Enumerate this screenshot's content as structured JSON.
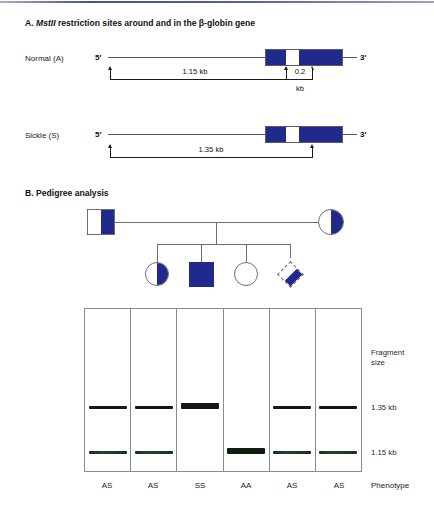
{
  "figure": {
    "panelA": {
      "heading_prefix": "A. ",
      "heading_italic": "MstII",
      "heading_rest": " restriction sites around and in the β-globin gene",
      "rows": [
        {
          "name": "Normal (A)",
          "five_prime": "5′",
          "three_prime": "3′",
          "measurements": [
            {
              "value": "1.15 kb"
            },
            {
              "value": "0.2",
              "unit": "kb"
            }
          ]
        },
        {
          "name": "Sickle (S)",
          "five_prime": "5′",
          "three_prime": "3′",
          "measurements": [
            {
              "value": "1.35 kb"
            }
          ]
        }
      ]
    },
    "panelB": {
      "heading": "B. Pedigree analysis",
      "symbols": [
        {
          "name": "father",
          "shape": "square",
          "fill": "half"
        },
        {
          "name": "mother",
          "shape": "circle",
          "fill": "half"
        },
        {
          "name": "child-1",
          "shape": "circle",
          "fill": "half"
        },
        {
          "name": "child-2",
          "shape": "square",
          "fill": "full"
        },
        {
          "name": "child-3",
          "shape": "circle",
          "fill": "none"
        },
        {
          "name": "fetus",
          "shape": "diamond",
          "fill": "half"
        }
      ]
    },
    "gel": {
      "right_label_line1": "Fragment",
      "right_label_line2": "size",
      "marker_135": "1.35 kb",
      "marker_115": "1.15 kb",
      "phenotype_label": "Phenotype",
      "lanes": [
        {
          "phenotype": "AS",
          "bands": [
            "1.35",
            "1.15"
          ]
        },
        {
          "phenotype": "AS",
          "bands": [
            "1.35",
            "1.15"
          ]
        },
        {
          "phenotype": "SS",
          "bands": [
            "1.35"
          ]
        },
        {
          "phenotype": "AA",
          "bands": [
            "1.15"
          ]
        },
        {
          "phenotype": "AS",
          "bands": [
            "1.35",
            "1.15"
          ]
        },
        {
          "phenotype": "AS",
          "bands": [
            "1.35",
            "1.15"
          ]
        }
      ]
    },
    "colors": {
      "exon_blue": "#1f2a8c",
      "band_dark": "#16161a",
      "band_green": "#1d4a26",
      "rule_blue": "#2c3478"
    }
  }
}
